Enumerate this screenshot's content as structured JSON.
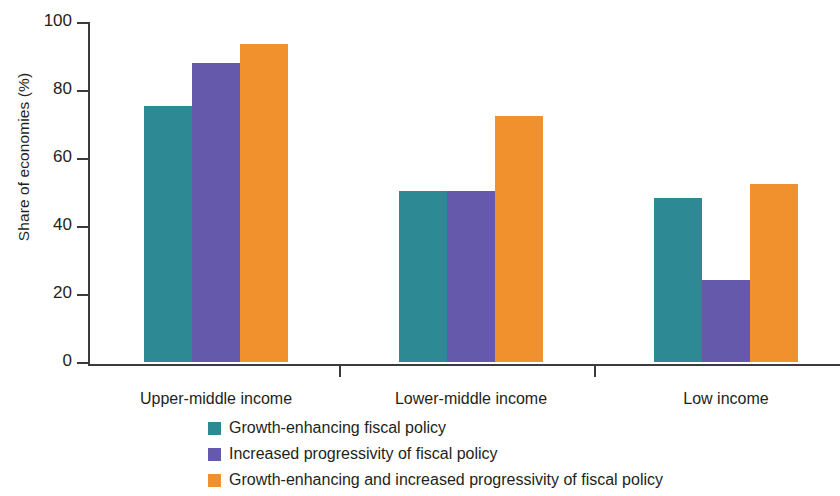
{
  "chart_data": {
    "type": "bar",
    "title": "",
    "xlabel": "",
    "ylabel": "Share of economies (%)",
    "ylim": [
      0,
      100
    ],
    "yticks": [
      0,
      20,
      40,
      60,
      80,
      100
    ],
    "ytick_labels": [
      "0",
      "20",
      "40",
      "60",
      "80",
      "100"
    ],
    "grid": false,
    "legend_position": "bottom",
    "categories": [
      "Upper-middle income",
      "Lower-middle income",
      "Low income"
    ],
    "series": [
      {
        "name": "Growth-enhancing fiscal policy",
        "color": "#2d8a94",
        "values": [
          75,
          50,
          48
        ]
      },
      {
        "name": "Increased progressivity of fiscal policy",
        "color": "#6559ab",
        "values": [
          87.5,
          50,
          24
        ]
      },
      {
        "name": "Growth-enhancing and increased progressivity of fiscal policy",
        "color": "#f0912d",
        "values": [
          93,
          72,
          52
        ]
      }
    ]
  }
}
